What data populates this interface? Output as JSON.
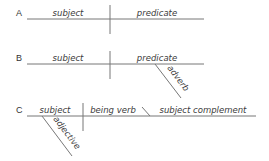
{
  "diagrams": [
    {
      "label": "A",
      "words": {
        "subject": "subject",
        "predicate": "predicate"
      }
    },
    {
      "label": "B",
      "words": {
        "subject": "subject",
        "predicate": "predicate",
        "modifier": "adverb"
      }
    },
    {
      "label": "C",
      "words": {
        "subject": "subject",
        "verb": "being verb",
        "complement": "subject complement",
        "modifier": "adjective"
      }
    }
  ],
  "colors": {
    "line": "#777777",
    "text": "#333333",
    "background": "#ffffff"
  }
}
